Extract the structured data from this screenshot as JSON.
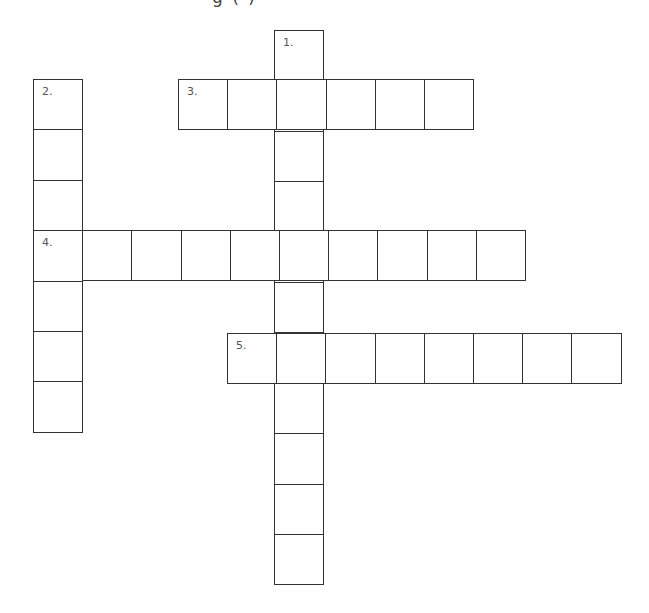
{
  "heading_fragment": "g ( )",
  "grid": {
    "cell_width": 49.2,
    "cell_height": 50.4,
    "line_color": "#333333",
    "entries": [
      {
        "number": "1.",
        "direction": "down",
        "length": 11,
        "x": 274,
        "y": 30
      },
      {
        "number": "2.",
        "direction": "down",
        "length": 7,
        "x": 33,
        "y": 79
      },
      {
        "number": "3.",
        "direction": "across",
        "length": 6,
        "x": 178,
        "y": 79
      },
      {
        "number": "4.",
        "direction": "across",
        "length": 10,
        "x": 33,
        "y": 230
      },
      {
        "number": "5.",
        "direction": "across",
        "length": 8,
        "x": 227,
        "y": 333
      }
    ]
  }
}
